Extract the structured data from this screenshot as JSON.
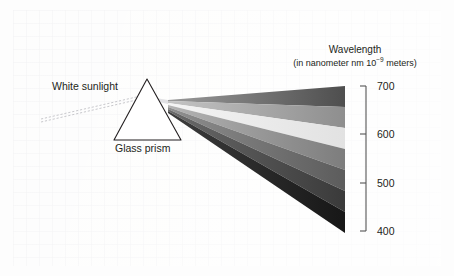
{
  "figure": {
    "background_color": "#fbfbfa",
    "plate_border_color": "#f2f2f1"
  },
  "labels": {
    "white_sunlight": "White sunlight",
    "glass_prism": "Glass prism"
  },
  "axis": {
    "title": "Wavelength",
    "subtitle_prefix": "(in nanometer nm 10",
    "subtitle_exponent": "−9",
    "subtitle_suffix": " meters)",
    "ticks": [
      {
        "value": "700",
        "y": 86
      },
      {
        "value": "600",
        "y": 134
      },
      {
        "value": "500",
        "y": 183
      },
      {
        "value": "400",
        "y": 231
      }
    ],
    "line_color": "#555555",
    "range_top_nm": 700,
    "range_bottom_nm": 400
  },
  "prism": {
    "apex": {
      "x": 147,
      "y": 79
    },
    "base_left": {
      "x": 114,
      "y": 140
    },
    "base_right": {
      "x": 181,
      "y": 140
    },
    "outline_color": "#231f20",
    "fill_color": "#ffffff"
  },
  "incoming_ray": {
    "name": "white-sunlight-ray",
    "start": {
      "x": 41,
      "y": 121
    },
    "end": {
      "x": 143,
      "y": 97
    },
    "style": "dotted",
    "color": "#b9b9bd"
  },
  "spectrum": {
    "origin": {
      "x": 168,
      "y": 100
    },
    "right_edge_x": 345,
    "top_right_y": 86,
    "bottom_right_y": 233,
    "bands": [
      {
        "name": "band-red",
        "color": "#4e4e4e",
        "top_right_y": 86,
        "bottom_right_y": 107
      },
      {
        "name": "band-orange",
        "color": "#8e8e8e",
        "top_right_y": 107,
        "bottom_right_y": 128
      },
      {
        "name": "band-yellow",
        "color": "#e2e2e2",
        "top_right_y": 128,
        "bottom_right_y": 149
      },
      {
        "name": "band-green",
        "color": "#7d7d7d",
        "top_right_y": 149,
        "bottom_right_y": 170
      },
      {
        "name": "band-cyan",
        "color": "#5c5c5c",
        "top_right_y": 170,
        "bottom_right_y": 191
      },
      {
        "name": "band-blue",
        "color": "#3a3a3a",
        "top_right_y": 191,
        "bottom_right_y": 212
      },
      {
        "name": "band-violet",
        "color": "#171717",
        "top_right_y": 212,
        "bottom_right_y": 233
      }
    ]
  }
}
